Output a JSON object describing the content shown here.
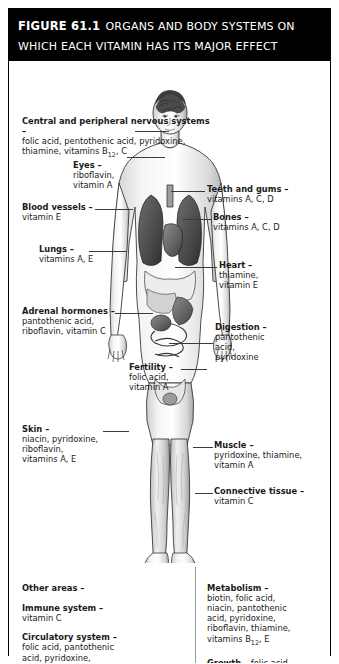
{
  "figure": {
    "number": "FIGURE 61.1",
    "title": "ORGANS AND BODY SYSTEMS ON WHICH EACH VITAMIN HAS ITS MAJOR EFFECT"
  },
  "illustration": {
    "name": "human-body-anatomy-diagram",
    "description": "Front-facing human figure showing internal organs"
  },
  "callouts_left": [
    {
      "id": "nervous-systems",
      "heading": "Central and peripheral nervous systems –",
      "body": "folic acid, pentothenic acid, pyridoxine, thiamine, vitamins B12, C",
      "line1": "folic acid, pentothenic acid, pyridoxine,",
      "line2_pre": "thiamine, vitamins B",
      "line2_sub": "12",
      "line2_post": ", C"
    },
    {
      "id": "eyes",
      "heading": "Eyes –",
      "body": "riboflavin, vitamin A",
      "line1": "riboflavin,",
      "line2": "vitamin A"
    },
    {
      "id": "blood-vessels",
      "heading": "Blood vessels –",
      "body": "vitamin E",
      "line1": "vitamin E"
    },
    {
      "id": "lungs",
      "heading": "Lungs –",
      "body": "vitamins A, E",
      "line1": "vitamins A, E"
    },
    {
      "id": "adrenal-hormones",
      "heading": "Adrenal hormones –",
      "body": "pantothenic acid, riboflavin, vitamin C",
      "line1": "pantothenic acid,",
      "line2": "riboflavin, vitamin C"
    },
    {
      "id": "fertility",
      "heading": "Fertility –",
      "body": "folic acid, vitamin A",
      "line1": "folic acid,",
      "line2": "vitamin A"
    },
    {
      "id": "skin",
      "heading": "Skin –",
      "body": "niacin, pyridoxine, riboflavin, vitamins A, E",
      "line1": "niacin, pyridoxine,",
      "line2": "riboflavin,",
      "line3": "vitamins A, E"
    }
  ],
  "callouts_right": [
    {
      "id": "teeth-and-gums",
      "heading": "Teeth and gums –",
      "body": "vitamins A, C, D",
      "line1": "vitamins A, C, D"
    },
    {
      "id": "bones",
      "heading": "Bones –",
      "body": "vitamins A, C, D",
      "line1": "vitamins A, C, D"
    },
    {
      "id": "heart",
      "heading": "Heart –",
      "body": "thiamine, vitamin E",
      "line1": "thiamine,",
      "line2": "vitamin E"
    },
    {
      "id": "digestion",
      "heading": "Digestion –",
      "body": "pantothenic acid, pyridoxine",
      "line1": "pantothenic",
      "line2": "acid,",
      "line3": "pyridoxine"
    },
    {
      "id": "muscle",
      "heading": "Muscle –",
      "body": "pyridoxine, thiamine, vitamin A",
      "line1": "pyridoxine, thiamine,",
      "line2": "vitamin A"
    },
    {
      "id": "connective-tissue",
      "heading": "Connective tissue –",
      "body": "vitamin C",
      "line1": "vitamin C"
    }
  ],
  "bottom_left": {
    "other_areas_heading": "Other areas –",
    "items": [
      {
        "id": "immune-system",
        "heading": "Immune system –",
        "line1": "vitamin C"
      },
      {
        "id": "circulatory-system",
        "heading": "Circulatory system –",
        "line1": "folic acid, pantothenic",
        "line2": "acid, pyridoxine,",
        "line3_pre": "vitamins B",
        "line3_sub": "12",
        "line3_post": ", E, K"
      }
    ]
  },
  "bottom_right": {
    "items": [
      {
        "id": "metabolism",
        "heading": "Metabolism –",
        "line1": "biotin, folic acid,",
        "line2": "niacin, pantothenic",
        "line3": "acid, pyridoxine,",
        "line4": "riboflavin, thiamine,",
        "line5_pre": "vitamins B",
        "line5_sub": "12",
        "line5_post": ", E"
      },
      {
        "id": "growth",
        "heading": "Growth –",
        "heading_inline_rest": " folic acid,",
        "line2_pre": "vitamins A, B",
        "line2_sub": "12"
      }
    ]
  },
  "colors": {
    "header_bg": "#000000",
    "header_text": "#ffffff",
    "page_bg": "#ffffff",
    "text": "#1a1a1a",
    "leader_line": "#3a3a3a"
  }
}
